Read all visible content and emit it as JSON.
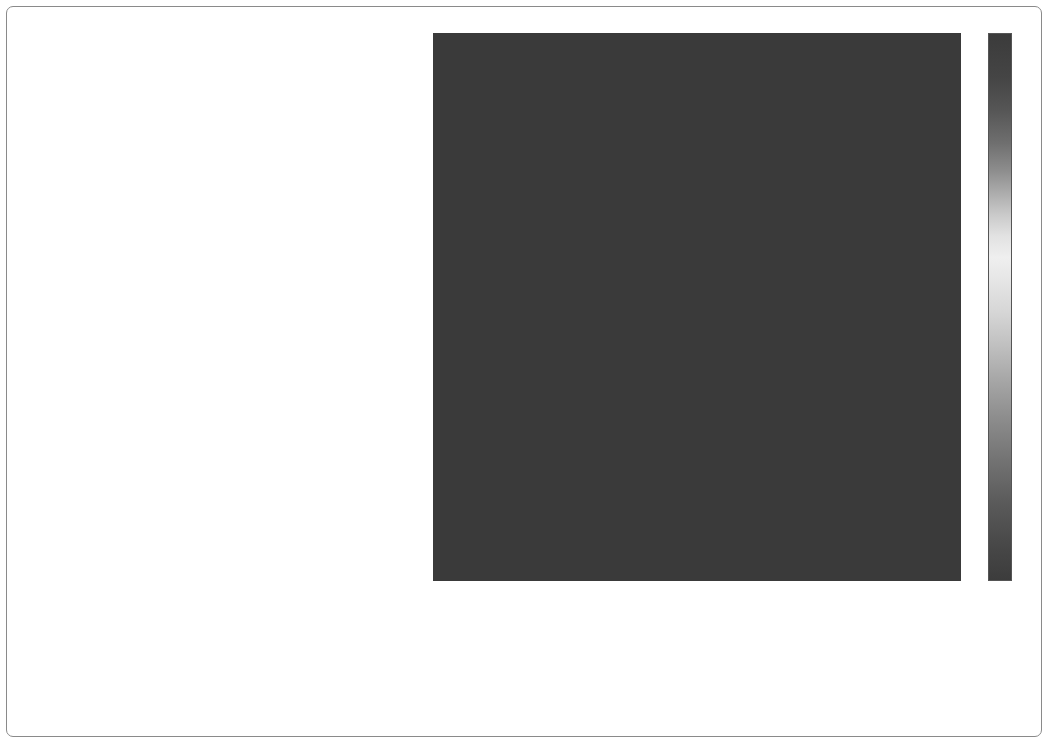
{
  "figure": {
    "type": "confusion-matrix-heatmap",
    "ylabel": "",
    "xlabel": "",
    "title": ""
  },
  "colorbar": {
    "ticks": [
      "0",
      "0.1",
      "0.2",
      "0.3",
      "0.4",
      "0.5",
      "0.6",
      "0.7",
      "0.8",
      "0.9"
    ],
    "tick_values": [
      0,
      0.1,
      0.2,
      0.3,
      0.4,
      0.5,
      0.6,
      0.7,
      0.8,
      0.9
    ],
    "vmin": 0,
    "vmax": 0.95,
    "colormap": "grayscale-jet"
  },
  "chart_data": {
    "type": "heatmap",
    "title": "",
    "xlabel": "",
    "ylabel": "",
    "grid": false,
    "legend_position": "right",
    "colorbar_label": "",
    "zlim": [
      0,
      0.95
    ],
    "categories": [
      "Container Ship",
      "Bulk Carrier",
      "Passengers Ship",
      "Ro-ro/passenger Ship",
      "Ro-ro Cargo",
      "Tug",
      "Vehicles Carrier",
      "Reefer",
      "Yacht",
      "Sailing Vessel",
      "Heavy Load Carrier",
      "Wood Chips Carrier",
      "Livestock Carrier",
      "Fire Fighting Vessel",
      "Patrol Vessel",
      "Platform",
      "Standby Safety Vessel",
      "Combat Vessel",
      "Training Ship",
      "Icebreaker",
      "Replenishment Vessel",
      "Tankers",
      "Fishing Vessels",
      "Supply Vessels",
      "Carrier/Floating",
      "Dredgers"
    ],
    "x": [
      "Container Ship",
      "Bulk Carrier",
      "Passengers Ship",
      "Ro-ro/passenger Ship",
      "Ro-ro Cargo",
      "Tug",
      "Vehicles Carrier",
      "Reefer",
      "Yacht",
      "Sailing Vessel",
      "Heavy Load Carrier",
      "Wood Chips Carrier",
      "Livestock Carrier",
      "Fire Fighting Vessel",
      "Patrol Vessel",
      "Platform",
      "Standby Safety Vessel",
      "Combat Vessel",
      "Training Ship",
      "Icebreaker",
      "Replenishment Vessel",
      "Tankers",
      "Fishing Vessels",
      "Supply Vessels",
      "Carrier/Floating",
      "Dredgers"
    ],
    "y": [
      "Container Ship",
      "Bulk Carrier",
      "Passengers Ship",
      "Ro-ro/passenger Ship",
      "Ro-ro Cargo",
      "Tug",
      "Vehicles Carrier",
      "Reefer",
      "Yacht",
      "Sailing Vessel",
      "Heavy Load Carrier",
      "Wood Chips Carrier",
      "Livestock Carrier",
      "Fire Fighting Vessel",
      "Patrol Vessel",
      "Platform",
      "Standby Safety Vessel",
      "Combat Vessel",
      "Training Ship",
      "Icebreaker",
      "Replenishment Vessel",
      "Tankers",
      "Fishing Vessels",
      "Supply Vessels",
      "Carrier/Floating",
      "Dredgers"
    ],
    "values": [
      [
        0.06,
        0.05,
        0.03,
        0.02,
        0.02,
        0.02,
        0.02,
        0.01,
        0.01,
        0.01,
        0.01,
        0.01,
        0.01,
        0.01,
        0.01,
        0.01,
        0.01,
        0.01,
        0.01,
        0.01,
        0.01,
        0.02,
        0.01,
        0.01,
        0.01,
        0.01
      ],
      [
        0.04,
        0.14,
        0.02,
        0.02,
        0.02,
        0.02,
        0.02,
        0.01,
        0.01,
        0.01,
        0.01,
        0.01,
        0.01,
        0.01,
        0.01,
        0.01,
        0.01,
        0.01,
        0.01,
        0.01,
        0.01,
        0.02,
        0.01,
        0.01,
        0.1,
        0.01
      ],
      [
        0.02,
        0.03,
        0.22,
        0.2,
        0.05,
        0.03,
        0.02,
        0.01,
        0.02,
        0.02,
        0.01,
        0.01,
        0.02,
        0.02,
        0.02,
        0.01,
        0.02,
        0.01,
        0.03,
        0.01,
        0.01,
        0.01,
        0.01,
        0.01,
        0.02,
        0.01
      ],
      [
        0.02,
        0.03,
        0.21,
        0.24,
        0.06,
        0.03,
        0.02,
        0.01,
        0.01,
        0.02,
        0.01,
        0.01,
        0.02,
        0.02,
        0.01,
        0.01,
        0.02,
        0.01,
        0.02,
        0.01,
        0.01,
        0.01,
        0.01,
        0.01,
        0.02,
        0.01
      ],
      [
        0.02,
        0.03,
        0.08,
        0.12,
        0.26,
        0.04,
        0.02,
        0.02,
        0.01,
        0.01,
        0.01,
        0.01,
        0.02,
        0.01,
        0.01,
        0.01,
        0.02,
        0.01,
        0.02,
        0.01,
        0.01,
        0.01,
        0.01,
        0.01,
        0.02,
        0.01
      ],
      [
        0.02,
        0.02,
        0.03,
        0.05,
        0.06,
        0.21,
        0.02,
        0.01,
        0.01,
        0.01,
        0.01,
        0.01,
        0.01,
        0.17,
        0.01,
        0.01,
        0.04,
        0.01,
        0.02,
        0.01,
        0.01,
        0.01,
        0.01,
        0.03,
        0.02,
        0.01
      ],
      [
        0.02,
        0.02,
        0.03,
        0.03,
        0.06,
        0.03,
        0.12,
        0.02,
        0.01,
        0.01,
        0.01,
        0.01,
        0.01,
        0.01,
        0.01,
        0.01,
        0.02,
        0.01,
        0.01,
        0.01,
        0.01,
        0.01,
        0.01,
        0.01,
        0.1,
        0.01
      ],
      [
        0.02,
        0.02,
        0.02,
        0.02,
        0.02,
        0.02,
        0.03,
        0.1,
        0.02,
        0.01,
        0.01,
        0.01,
        0.03,
        0.01,
        0.01,
        0.01,
        0.02,
        0.01,
        0.02,
        0.01,
        0.01,
        0.01,
        0.01,
        0.01,
        0.02,
        0.01
      ],
      [
        0.02,
        0.02,
        0.02,
        0.02,
        0.02,
        0.02,
        0.02,
        0.03,
        0.13,
        0.04,
        0.01,
        0.01,
        0.01,
        0.01,
        0.02,
        0.01,
        0.02,
        0.01,
        0.01,
        0.01,
        0.01,
        0.01,
        0.02,
        0.01,
        0.02,
        0.01
      ],
      [
        0.01,
        0.02,
        0.02,
        0.02,
        0.02,
        0.02,
        0.02,
        0.02,
        0.05,
        0.16,
        0.02,
        0.01,
        0.01,
        0.01,
        0.02,
        0.01,
        0.02,
        0.01,
        0.01,
        0.01,
        0.01,
        0.01,
        0.02,
        0.01,
        0.02,
        0.01
      ],
      [
        0.01,
        0.02,
        0.02,
        0.02,
        0.02,
        0.02,
        0.01,
        0.01,
        0.01,
        0.02,
        0.57,
        0.02,
        0.01,
        0.01,
        0.01,
        0.01,
        0.02,
        0.01,
        0.01,
        0.01,
        0.01,
        0.01,
        0.01,
        0.01,
        0.02,
        0.01
      ],
      [
        0.01,
        0.02,
        0.02,
        0.02,
        0.02,
        0.02,
        0.01,
        0.01,
        0.01,
        0.01,
        0.03,
        0.14,
        0.02,
        0.01,
        0.01,
        0.01,
        0.02,
        0.01,
        0.01,
        0.01,
        0.01,
        0.01,
        0.01,
        0.01,
        0.02,
        0.01
      ],
      [
        0.01,
        0.02,
        0.03,
        0.03,
        0.04,
        0.02,
        0.02,
        0.02,
        0.01,
        0.01,
        0.02,
        0.03,
        0.3,
        0.04,
        0.01,
        0.01,
        0.02,
        0.01,
        0.02,
        0.01,
        0.01,
        0.01,
        0.01,
        0.1,
        0.02,
        0.03
      ],
      [
        0.01,
        0.02,
        0.02,
        0.02,
        0.02,
        0.28,
        0.02,
        0.01,
        0.01,
        0.01,
        0.01,
        0.02,
        0.05,
        0.33,
        0.02,
        0.01,
        0.06,
        0.01,
        0.02,
        0.01,
        0.01,
        0.01,
        0.01,
        0.1,
        0.02,
        0.02
      ],
      [
        0.01,
        0.02,
        0.02,
        0.02,
        0.02,
        0.03,
        0.02,
        0.01,
        0.02,
        0.02,
        0.01,
        0.01,
        0.02,
        0.04,
        0.22,
        0.01,
        0.04,
        0.03,
        0.02,
        0.01,
        0.01,
        0.01,
        0.02,
        0.02,
        0.02,
        0.01
      ],
      [
        0.01,
        0.01,
        0.01,
        0.01,
        0.01,
        0.02,
        0.01,
        0.01,
        0.01,
        0.01,
        0.01,
        0.01,
        0.01,
        0.01,
        0.01,
        0.06,
        0.02,
        0.01,
        0.01,
        0.01,
        0.01,
        0.01,
        0.01,
        0.01,
        0.02,
        0.01
      ],
      [
        0.01,
        0.02,
        0.03,
        0.03,
        0.03,
        0.06,
        0.02,
        0.01,
        0.01,
        0.01,
        0.01,
        0.01,
        0.02,
        0.05,
        0.03,
        0.02,
        0.44,
        0.04,
        0.02,
        0.01,
        0.02,
        0.01,
        0.02,
        0.14,
        0.02,
        0.02
      ],
      [
        0.01,
        0.02,
        0.02,
        0.02,
        0.02,
        0.03,
        0.02,
        0.01,
        0.01,
        0.01,
        0.01,
        0.01,
        0.01,
        0.02,
        0.04,
        0.01,
        0.05,
        0.18,
        0.04,
        0.01,
        0.02,
        0.01,
        0.01,
        0.03,
        0.02,
        0.01
      ],
      [
        0.01,
        0.02,
        0.03,
        0.03,
        0.03,
        0.21,
        0.02,
        0.01,
        0.01,
        0.01,
        0.01,
        0.01,
        0.02,
        0.03,
        0.02,
        0.01,
        0.04,
        0.05,
        0.23,
        0.02,
        0.02,
        0.01,
        0.01,
        0.03,
        0.02,
        0.01
      ],
      [
        0.01,
        0.02,
        0.02,
        0.02,
        0.02,
        0.03,
        0.01,
        0.01,
        0.01,
        0.01,
        0.01,
        0.01,
        0.01,
        0.02,
        0.01,
        0.01,
        0.02,
        0.02,
        0.04,
        0.16,
        0.03,
        0.01,
        0.01,
        0.02,
        0.02,
        0.01
      ],
      [
        0.01,
        0.02,
        0.02,
        0.02,
        0.02,
        0.03,
        0.02,
        0.08,
        0.01,
        0.01,
        0.01,
        0.01,
        0.02,
        0.02,
        0.02,
        0.01,
        0.03,
        0.02,
        0.03,
        0.04,
        0.2,
        0.01,
        0.01,
        0.03,
        0.02,
        0.01
      ],
      [
        0.02,
        0.1,
        0.02,
        0.02,
        0.02,
        0.02,
        0.02,
        0.01,
        0.01,
        0.01,
        0.01,
        0.01,
        0.01,
        0.01,
        0.01,
        0.01,
        0.02,
        0.01,
        0.01,
        0.01,
        0.01,
        0.13,
        0.01,
        0.01,
        0.02,
        0.01
      ],
      [
        0.01,
        0.02,
        0.02,
        0.02,
        0.02,
        0.03,
        0.01,
        0.01,
        0.02,
        0.02,
        0.01,
        0.01,
        0.01,
        0.02,
        0.02,
        0.01,
        0.03,
        0.01,
        0.01,
        0.01,
        0.01,
        0.01,
        0.16,
        0.03,
        0.02,
        0.01
      ],
      [
        0.01,
        0.02,
        0.02,
        0.02,
        0.02,
        0.09,
        0.02,
        0.01,
        0.01,
        0.01,
        0.01,
        0.01,
        0.03,
        0.08,
        0.02,
        0.01,
        0.09,
        0.02,
        0.02,
        0.01,
        0.02,
        0.01,
        0.02,
        0.25,
        0.02,
        0.02
      ],
      [
        0.02,
        0.14,
        0.02,
        0.02,
        0.02,
        0.02,
        0.02,
        0.01,
        0.01,
        0.01,
        0.01,
        0.01,
        0.01,
        0.01,
        0.01,
        0.01,
        0.02,
        0.01,
        0.01,
        0.01,
        0.01,
        0.02,
        0.01,
        0.01,
        0.62,
        0.01
      ],
      [
        0.01,
        0.02,
        0.02,
        0.02,
        0.02,
        0.02,
        0.01,
        0.01,
        0.01,
        0.01,
        0.01,
        0.01,
        0.03,
        0.02,
        0.01,
        0.01,
        0.02,
        0.01,
        0.01,
        0.01,
        0.01,
        0.01,
        0.01,
        0.02,
        0.02,
        0.09
      ]
    ]
  }
}
